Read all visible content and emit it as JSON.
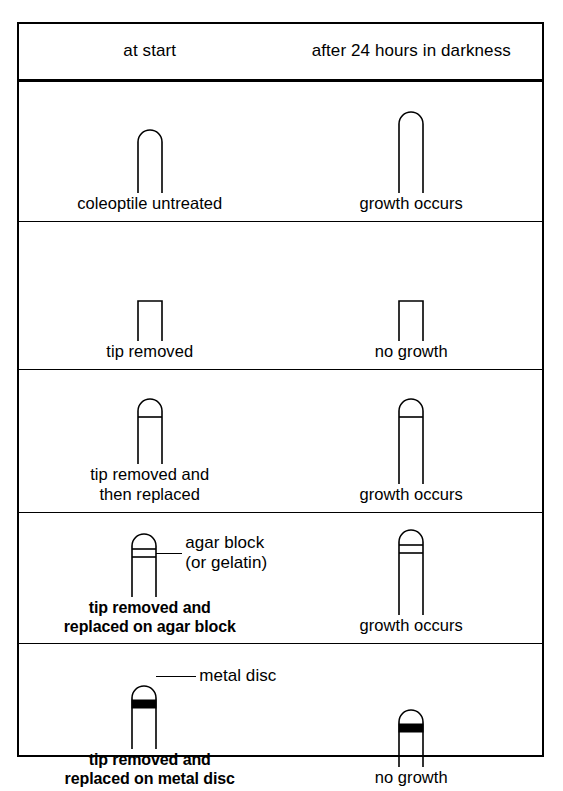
{
  "figure": {
    "columns": [
      {
        "label": "at start"
      },
      {
        "label": "after 24 hours\nin darkness"
      }
    ],
    "rows": [
      {
        "id": "untreated",
        "start": {
          "caption": "coleoptile untreated",
          "shape": "rounded-tip",
          "height_px": 62,
          "band": "none"
        },
        "after": {
          "caption": "growth occurs",
          "shape": "rounded-tip",
          "height_px": 80,
          "band": "none"
        }
      },
      {
        "id": "tip-removed",
        "start": {
          "caption": "tip removed",
          "shape": "flat-cut",
          "height_px": 38,
          "band": "none"
        },
        "after": {
          "caption": "no growth",
          "shape": "flat-cut",
          "height_px": 38,
          "band": "none"
        }
      },
      {
        "id": "tip-replaced",
        "start": {
          "caption": "tip removed and\nthen replaced",
          "shape": "rounded-tip",
          "height_px": 64,
          "band": "single-line"
        },
        "after": {
          "caption": "growth occurs",
          "shape": "rounded-tip",
          "height_px": 84,
          "band": "single-line"
        }
      },
      {
        "id": "agar-block",
        "start": {
          "caption": "tip removed and\nreplaced on agar block",
          "caption_bold": true,
          "shape": "rounded-tip",
          "height_px": 62,
          "band": "double-line",
          "annotation": "agar block\n(or gelatin)"
        },
        "after": {
          "caption": "growth occurs",
          "shape": "rounded-tip",
          "height_px": 84,
          "band": "double-line"
        }
      },
      {
        "id": "metal-disc",
        "start": {
          "caption": "tip removed and\nreplaced on metal disc",
          "caption_bold": true,
          "shape": "rounded-tip",
          "height_px": 62,
          "band": "solid-black",
          "annotation": "metal disc"
        },
        "after": {
          "caption": "no growth",
          "shape": "rounded-tip",
          "height_px": 56,
          "band": "solid-black"
        }
      }
    ],
    "colors": {
      "ink": "#000000",
      "paper": "#ffffff"
    }
  }
}
